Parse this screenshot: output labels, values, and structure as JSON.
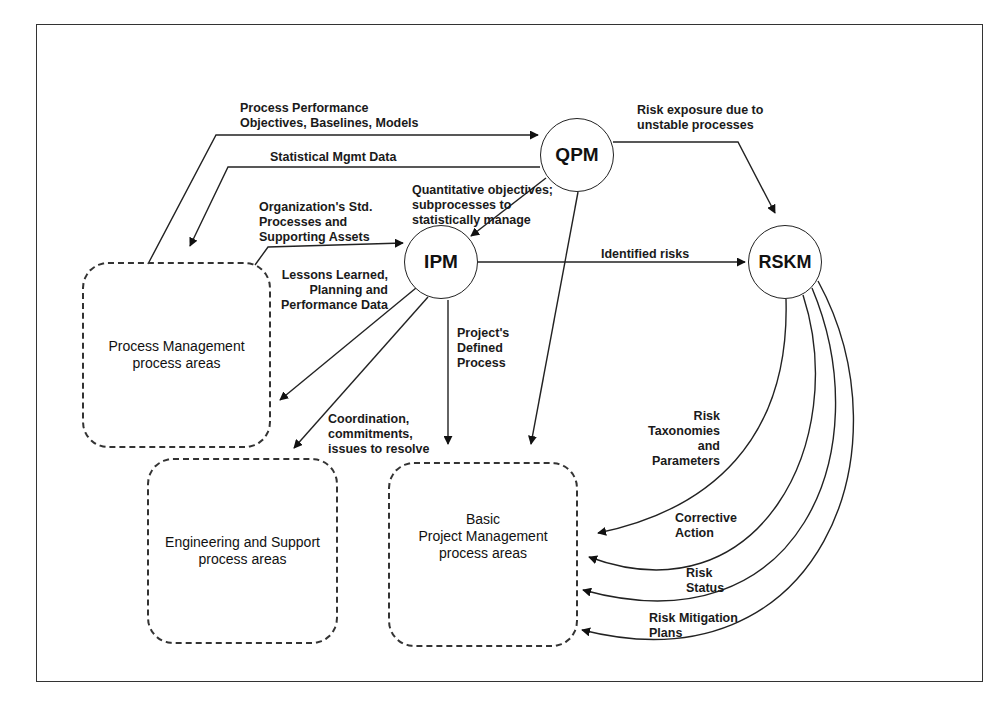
{
  "diagram": {
    "nodes": {
      "qpm": "QPM",
      "ipm": "IPM",
      "rskm": "RSKM"
    },
    "areas": {
      "process_management": "Process Management\nprocess areas",
      "engineering_support": "Engineering and Support\nprocess areas",
      "basic_project_management": "Basic\nProject Management\nprocess areas"
    },
    "flows": {
      "ppo": "Process Performance\nObjectives, Baselines, Models",
      "stat_mgmt": "Statistical Mgmt Data",
      "quant_obj": "Quantitative objectives;\nsubprocesses to\nstatistically manage",
      "org_std": "Organization's Std.\nProcesses and\nSupporting Assets",
      "lessons": "Lessons Learned,\nPlanning and\nPerformance Data",
      "defined_process": "Project's\nDefined\nProcess",
      "coordination": "Coordination,\ncommitments,\nissues to resolve",
      "identified_risks": "Identified risks",
      "risk_exposure": "Risk exposure due to\nunstable processes",
      "taxonomies": "Risk\nTaxonomies\nand\nParameters",
      "corrective": "Corrective\nAction",
      "risk_status": "Risk\nStatus",
      "mitigation": "Risk Mitigation\nPlans"
    },
    "colors": {
      "line": "#222222",
      "background": "#ffffff"
    }
  }
}
